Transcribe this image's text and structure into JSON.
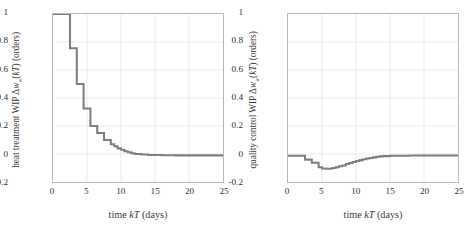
{
  "figure": {
    "background": "#ffffff",
    "panels": [
      "left",
      "right"
    ]
  },
  "panel_left": {
    "ylabel": "heat treatment WIP Δwᴡ(kT) (orders)",
    "xlabel": "time kT (days)"
  },
  "panel_right": {
    "ylabel": "quality control WIP Δwᴡ(kT) (orders)",
    "xlabel": "time kT (days)"
  },
  "axis": {
    "xticks": [
      "0",
      "5",
      "10",
      "15",
      "20",
      "25"
    ],
    "yticks": [
      "1",
      "0.8",
      "0.6",
      "0.4",
      "0.2",
      "0",
      "-0.2"
    ],
    "xtick_values": [
      0,
      5,
      10,
      15,
      20,
      25
    ],
    "ytick_values": [
      1,
      0.8,
      0.6,
      0.4,
      0.2,
      0,
      -0.2
    ],
    "xlim": [
      0,
      25
    ],
    "ylim": [
      -0.2,
      1
    ],
    "grid": true,
    "grid_color": "#e2e2e2",
    "frame_color": "#b9b9b9",
    "line_color": "#7f7f7f",
    "line_width": 2.1
  },
  "chart_data": [
    {
      "type": "line",
      "title": "",
      "subtitle": "",
      "drawstyle": "steps-post",
      "xlabel": "time kT (days)",
      "ylabel": "heat treatment WIP Δwᴡ(kT) (orders)",
      "xlim": [
        0,
        25
      ],
      "ylim": [
        -0.2,
        1
      ],
      "xticks": [
        0,
        5,
        10,
        15,
        20,
        25
      ],
      "yticks": [
        1,
        0.8,
        0.6,
        0.4,
        0.2,
        0,
        -0.2
      ],
      "grid": true,
      "legend": null,
      "series": [
        {
          "name": "heat treatment WIP",
          "color": "#7f7f7f",
          "x": [
            0,
            1,
            2,
            2.5,
            3,
            3.5,
            4,
            4.5,
            5,
            5.5,
            6,
            6.5,
            7,
            7.5,
            8,
            8.5,
            9,
            9.5,
            10,
            10.5,
            11,
            11.5,
            12,
            13,
            14,
            16,
            18,
            20,
            22,
            25
          ],
          "y": [
            1.0,
            1.0,
            1.0,
            0.755,
            0.755,
            0.5,
            0.5,
            0.325,
            0.325,
            0.2,
            0.2,
            0.15,
            0.15,
            0.1,
            0.1,
            0.07,
            0.055,
            0.04,
            0.03,
            0.02,
            0.012,
            0.006,
            0.0,
            -0.004,
            -0.007,
            -0.009,
            -0.01,
            -0.01,
            -0.01,
            -0.01
          ]
        }
      ]
    },
    {
      "type": "line",
      "title": "",
      "subtitle": "",
      "drawstyle": "steps-post",
      "xlabel": "time kT (days)",
      "ylabel": "quality control WIP Δwᴡ(kT) (orders)",
      "xlim": [
        0,
        25
      ],
      "ylim": [
        -0.2,
        1
      ],
      "xticks": [
        0,
        5,
        10,
        15,
        20,
        25
      ],
      "yticks": [
        1,
        0.8,
        0.6,
        0.4,
        0.2,
        0,
        -0.2
      ],
      "grid": true,
      "legend": null,
      "series": [
        {
          "name": "quality control WIP",
          "color": "#7f7f7f",
          "x": [
            0,
            1,
            2,
            2.5,
            3,
            3.5,
            4,
            4.5,
            5,
            5.5,
            6,
            6.5,
            7,
            7.5,
            8,
            8.5,
            9,
            9.5,
            10,
            10.5,
            11,
            11.5,
            12,
            12.5,
            13,
            13.5,
            14,
            15,
            16,
            18,
            20,
            22,
            25
          ],
          "y": [
            -0.012,
            -0.012,
            -0.012,
            -0.04,
            -0.04,
            -0.062,
            -0.062,
            -0.095,
            -0.103,
            -0.105,
            -0.105,
            -0.1,
            -0.095,
            -0.088,
            -0.082,
            -0.072,
            -0.064,
            -0.057,
            -0.05,
            -0.044,
            -0.038,
            -0.032,
            -0.028,
            -0.024,
            -0.02,
            -0.017,
            -0.015,
            -0.013,
            -0.012,
            -0.011,
            -0.011,
            -0.011,
            -0.011
          ]
        }
      ]
    }
  ]
}
